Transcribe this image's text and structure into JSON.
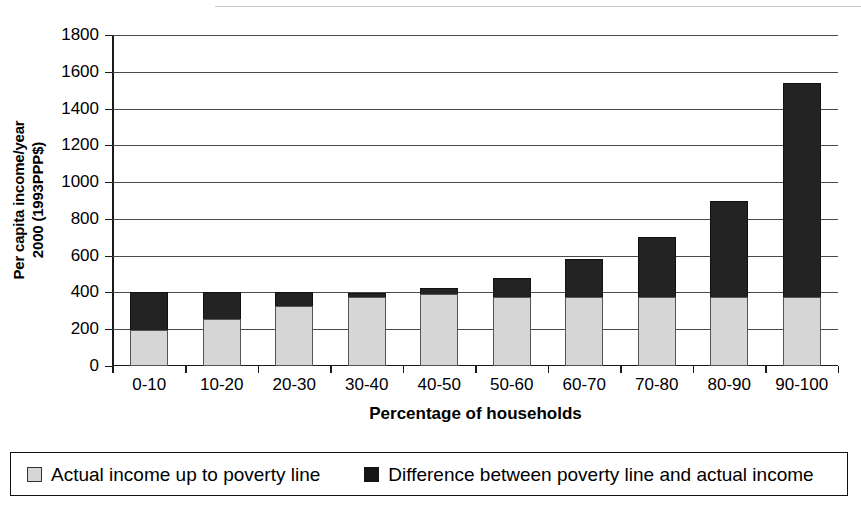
{
  "chart_data": {
    "type": "bar",
    "title": "",
    "subtitle": "",
    "stacked": true,
    "xlabel": "Percentage of households",
    "ylabel": "Per capita income/year 2000 (1993PPP$)",
    "ylabel_lines": [
      "Per capita income/year",
      "2000 (1993PPP$)"
    ],
    "ylim": [
      0,
      1800
    ],
    "ytick_step": 200,
    "yticks": [
      0,
      200,
      400,
      600,
      800,
      1000,
      1200,
      1400,
      1600,
      1800
    ],
    "ytick_labels": [
      "0",
      "200",
      "400",
      "600",
      "800",
      "1000",
      "1200",
      "1400",
      "1600",
      "1800"
    ],
    "categories": [
      "0-10",
      "10-20",
      "20-30",
      "30-40",
      "40-50",
      "50-60",
      "60-70",
      "70-80",
      "80-90",
      "90-100"
    ],
    "series": [
      {
        "name": "Actual income up to poverty line",
        "color": "#d6d6d6",
        "values": [
          195,
          255,
          325,
          378,
          393,
          375,
          375,
          375,
          375,
          375
        ]
      },
      {
        "name": "Difference between poverty line and actual income",
        "color": "#232323",
        "values": [
          205,
          145,
          75,
          17,
          32,
          105,
          205,
          325,
          520,
          1165
        ]
      }
    ],
    "totals": [
      400,
      400,
      400,
      395,
      425,
      480,
      580,
      700,
      895,
      1540
    ],
    "grid": "horizontal",
    "legend_position": "bottom"
  },
  "legend": {
    "items": [
      {
        "label": "Actual income up to poverty line",
        "marker": "light-square-swatch"
      },
      {
        "label": "Difference between poverty line and actual income",
        "marker": "dark-square-swatch"
      }
    ]
  }
}
